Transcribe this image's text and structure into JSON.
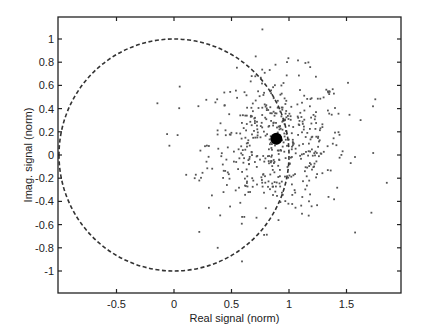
{
  "chart_data": {
    "type": "scatter",
    "title": "",
    "xlabel": "Real signal (norm)",
    "ylabel": "Imag. signal (norm)",
    "xlim": [
      -1.0,
      1.98
    ],
    "ylim": [
      -1.19,
      1.19
    ],
    "xticks": [
      -0.5,
      0,
      0.5,
      1,
      1.5
    ],
    "xtick_labels": [
      "-0.5",
      "0",
      "0.5",
      "1",
      "1.5"
    ],
    "yticks": [
      -1,
      -0.8,
      -0.6,
      -0.4,
      -0.2,
      0,
      0.2,
      0.4,
      0.6,
      0.8,
      1
    ],
    "ytick_labels": [
      "-1",
      "-0.8",
      "-0.6",
      "-0.4",
      "-0.2",
      "0",
      "0.2",
      "0.4",
      "0.6",
      "0.8",
      "1"
    ],
    "grid": false,
    "legend": null,
    "unit_circle": {
      "center": [
        0,
        0
      ],
      "radius": 1,
      "style": "dashed"
    },
    "highlight_point": {
      "x": 0.89,
      "y": 0.14,
      "label": "mean"
    },
    "scatter_cloud": {
      "description": "approx. 500 noisy samples centered near (0.9, 0.1)",
      "center": [
        0.9,
        0.1
      ],
      "std_real": 0.3,
      "std_imag": 0.3,
      "count": 500
    },
    "outliers": [
      {
        "x": 0.05,
        "y": 0.59
      },
      {
        "x": -0.06,
        "y": 0.18
      },
      {
        "x": -0.04,
        "y": 0.08
      },
      {
        "x": 1.75,
        "y": 0.48
      },
      {
        "x": 1.73,
        "y": 0.42
      },
      {
        "x": 1.85,
        "y": -0.24
      },
      {
        "x": 0.18,
        "y": -0.2
      },
      {
        "x": 0.19,
        "y": -0.17
      },
      {
        "x": 0.22,
        "y": -0.22
      },
      {
        "x": 0.38,
        "y": -0.8
      }
    ],
    "colors": {
      "points": "#555555",
      "circle": "#333333",
      "highlight": "#000000",
      "axes": "#222222"
    }
  }
}
